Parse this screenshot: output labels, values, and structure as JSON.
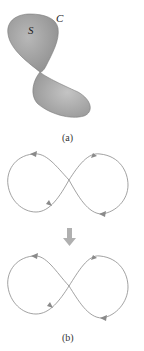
{
  "figure_a": {
    "surface_label": "S",
    "curve_label": "C",
    "caption": "(a)",
    "surface_fill": "#9e9e9e",
    "surface_fill_light": "#c8c8c8"
  },
  "transition_arrow": {
    "direction": "down",
    "color": "#b0b0b0"
  },
  "figure_b": {
    "caption": "(b)",
    "curve_color": "#8a8a8a",
    "top_curve": {
      "shape": "figure-eight",
      "arrows": [
        "left-lobe-top: pointing left",
        "left-lobe-bottom: pointing right/up",
        "right-lobe-top: pointing right/up",
        "right-lobe-bottom: pointing left"
      ]
    },
    "bottom_curve": {
      "shape": "figure-eight",
      "arrows": [
        "left-lobe-top: pointing left",
        "left-lobe-bottom: pointing right/up",
        "right-lobe-top: pointing right/up",
        "right-lobe-bottom: pointing left"
      ]
    }
  }
}
